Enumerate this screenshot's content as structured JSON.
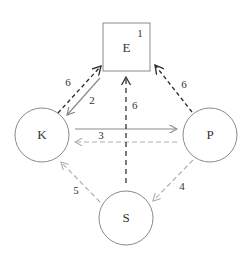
{
  "diagram": {
    "nodes": [
      {
        "id": "E",
        "label": "E",
        "shape": "square",
        "tag": "1"
      },
      {
        "id": "K",
        "label": "K",
        "shape": "circle"
      },
      {
        "id": "P",
        "label": "P",
        "shape": "circle"
      },
      {
        "id": "S",
        "label": "S",
        "shape": "circle"
      }
    ],
    "edges": [
      {
        "from": "K",
        "to": "E",
        "label": "6",
        "style": "dashed-dark"
      },
      {
        "from": "E",
        "to": "K",
        "label": "2",
        "style": "solid-gray"
      },
      {
        "from": "K",
        "to": "P",
        "label": "3",
        "style": "solid-gray"
      },
      {
        "from": "P",
        "to": "K",
        "label": "",
        "style": "dashed-light"
      },
      {
        "from": "P",
        "to": "E",
        "label": "6",
        "style": "dashed-dark"
      },
      {
        "from": "S",
        "to": "E",
        "label": "6",
        "style": "dashed-dark"
      },
      {
        "from": "P",
        "to": "S",
        "label": "4",
        "style": "dashed-light"
      },
      {
        "from": "S",
        "to": "K",
        "label": "5",
        "style": "dashed-light"
      }
    ],
    "colors": {
      "node_stroke": "#8a8a8a",
      "dark_dashed": "#333333",
      "solid_gray": "#8a8a8a",
      "light_dashed": "#b0b0b0",
      "text": "#333333"
    }
  }
}
